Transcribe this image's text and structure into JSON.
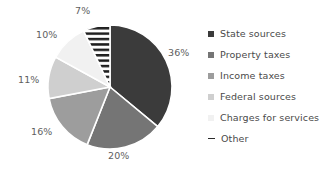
{
  "chart_data": {
    "type": "pie",
    "title": "",
    "legend_position": "right",
    "grid": false,
    "start_angle_deg": 0,
    "direction": "clockwise",
    "categories": [
      "State sources",
      "Property taxes",
      "Income taxes",
      "Federal sources",
      "Charges for services",
      "Other"
    ],
    "values": [
      36,
      20,
      16,
      11,
      10,
      7
    ],
    "value_unit": "%",
    "data_labels": [
      "36%",
      "20%",
      "16%",
      "11%",
      "10%",
      "7%"
    ],
    "colors": [
      "#3b3b3b",
      "#757575",
      "#9d9d9d",
      "#cfcfcf",
      "#f1f1f1",
      "#ffffff"
    ],
    "slice_patterns": [
      "solid",
      "solid",
      "solid",
      "solid",
      "solid",
      "horizontal-stripes"
    ],
    "slice_border_color": "#ffffff"
  },
  "pie": {
    "labels": [
      {
        "text": "36%",
        "left": 168,
        "top": 48
      },
      {
        "text": "20%",
        "left": 108,
        "top": 151
      },
      {
        "text": "16%",
        "left": 31,
        "top": 127
      },
      {
        "text": "11%",
        "left": 18,
        "top": 75
      },
      {
        "text": "10%",
        "left": 36,
        "top": 30
      },
      {
        "text": "7%",
        "left": 75,
        "top": 6
      }
    ]
  },
  "legend": {
    "items": [
      {
        "label": "State sources",
        "swatch": "#3b3b3b",
        "icon": "square-swatch-icon"
      },
      {
        "label": "Property taxes",
        "swatch": "#757575",
        "icon": "square-swatch-icon"
      },
      {
        "label": "Income taxes",
        "swatch": "#9d9d9d",
        "icon": "square-swatch-icon"
      },
      {
        "label": "Federal sources",
        "swatch": "#cfcfcf",
        "icon": "square-swatch-icon"
      },
      {
        "label": "Charges for services",
        "swatch": "#f1f1f1",
        "icon": "square-swatch-icon"
      },
      {
        "label": "Other",
        "swatch": "#ffffff",
        "icon": "hatch-line-swatch-icon"
      }
    ]
  }
}
